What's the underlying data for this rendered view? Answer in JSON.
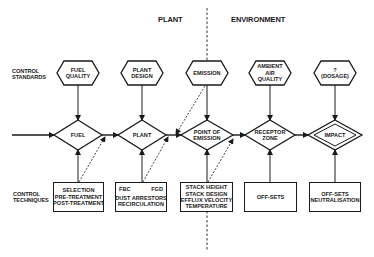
{
  "regions": {
    "left": "PLANT",
    "right": "ENVIRONMENT"
  },
  "row_labels": {
    "standards": [
      "CONTROL",
      "STANDARDS"
    ],
    "techniques": [
      "CONTROL",
      "TECHNIQUES"
    ]
  },
  "standards": [
    {
      "id": "fuel-quality",
      "label": "FUEL\nQUALITY",
      "cx": 78
    },
    {
      "id": "plant-design",
      "label": "PLANT\nDESIGN",
      "cx": 142
    },
    {
      "id": "emission",
      "label": "EMISSION",
      "cx": 207
    },
    {
      "id": "ambient-air-quality",
      "label": "AMBIENT\nAIR\nQUALITY",
      "cx": 270
    },
    {
      "id": "dosage",
      "label": "?\n(DOSAGE)",
      "cx": 335
    }
  ],
  "stages": [
    {
      "id": "fuel",
      "label": "FUEL",
      "cx": 78
    },
    {
      "id": "plant",
      "label": "PLANT",
      "cx": 142
    },
    {
      "id": "point-of-emission",
      "label": "POINT OF\nEMISSION",
      "cx": 207
    },
    {
      "id": "receptor-zone",
      "label": "RECEPTOR\nZONE",
      "cx": 270
    },
    {
      "id": "impact",
      "label": "IMPACT",
      "cx": 335,
      "double": true
    }
  ],
  "techniques": [
    {
      "id": "fuel-techniques",
      "lines": [
        "SELECTION",
        "PRE-TREATMENT",
        "POST-TREATMENT"
      ]
    },
    {
      "id": "plant-techniques",
      "split": [
        "FBC",
        "FGD"
      ],
      "lines": [
        "DUST ARRESTORS",
        "RECIRCULATION"
      ]
    },
    {
      "id": "emission-techniques",
      "lines": [
        "STACK HEIGHT",
        "STACK DESIGN",
        "EFFLUX VELOCITY",
        "TEMPERATURE"
      ]
    },
    {
      "id": "receptor-techniques",
      "lines": [
        "OFF-SETS"
      ]
    },
    {
      "id": "impact-techniques",
      "lines": [
        "OFF-SETS",
        "NEUTRALISATION"
      ]
    }
  ],
  "colors": {
    "ink": "#1a1a1a",
    "background": "#ffffff"
  }
}
